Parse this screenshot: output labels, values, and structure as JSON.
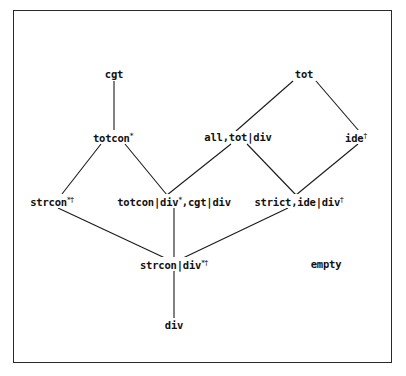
{
  "diagram": {
    "type": "lattice",
    "nodes": [
      {
        "id": "cgt",
        "label": "cgt",
        "sup": "",
        "x": 114,
        "y": 74
      },
      {
        "id": "tot",
        "label": "tot",
        "sup": "",
        "x": 304,
        "y": 74
      },
      {
        "id": "totcon",
        "label": "totcon",
        "sup": "*",
        "x": 113,
        "y": 137
      },
      {
        "id": "all_tot_div",
        "label": "all,tot|div",
        "sup": "",
        "x": 238,
        "y": 137
      },
      {
        "id": "ide",
        "label": "ide",
        "sup": "†",
        "x": 356,
        "y": 137
      },
      {
        "id": "strcon",
        "label": "strcon",
        "sup": "*†",
        "x": 52,
        "y": 201
      },
      {
        "id": "totcon_div_cgt_div",
        "label": "totcon|div",
        "sup": "*",
        "label2": ",cgt|div",
        "x": 174,
        "y": 201
      },
      {
        "id": "strict_ide_div",
        "label": "strict,ide|div",
        "sup": "†",
        "x": 299,
        "y": 201
      },
      {
        "id": "strcon_div",
        "label": "strcon|div",
        "sup": "*†",
        "x": 174,
        "y": 264
      },
      {
        "id": "empty",
        "label": "empty",
        "sup": "",
        "x": 326,
        "y": 264
      },
      {
        "id": "div",
        "label": "div",
        "sup": "",
        "x": 174,
        "y": 325
      }
    ],
    "edges": [
      {
        "from": "cgt",
        "to": "totcon",
        "x1": 114,
        "y1": 81,
        "x2": 114,
        "y2": 130
      },
      {
        "from": "tot",
        "to": "all_tot_div",
        "x1": 293,
        "y1": 81,
        "x2": 236,
        "y2": 131
      },
      {
        "from": "tot",
        "to": "ide",
        "x1": 316,
        "y1": 81,
        "x2": 359,
        "y2": 131
      },
      {
        "from": "totcon",
        "to": "strcon",
        "x1": 101,
        "y1": 144,
        "x2": 62,
        "y2": 194
      },
      {
        "from": "totcon",
        "to": "totcon_div_cgt_div",
        "x1": 125,
        "y1": 144,
        "x2": 167,
        "y2": 195
      },
      {
        "from": "all_tot_div",
        "to": "totcon_div_cgt_div",
        "x1": 231,
        "y1": 144,
        "x2": 167,
        "y2": 195
      },
      {
        "from": "all_tot_div",
        "to": "strict_ide_div",
        "x1": 247,
        "y1": 144,
        "x2": 296,
        "y2": 195
      },
      {
        "from": "ide",
        "to": "strict_ide_div",
        "x1": 358,
        "y1": 144,
        "x2": 296,
        "y2": 195
      },
      {
        "from": "strcon",
        "to": "strcon_div",
        "x1": 58,
        "y1": 208,
        "x2": 165,
        "y2": 258
      },
      {
        "from": "totcon_div_cgt_div",
        "to": "strcon_div",
        "x1": 174,
        "y1": 208,
        "x2": 174,
        "y2": 258
      },
      {
        "from": "strict_ide_div",
        "to": "strcon_div",
        "x1": 288,
        "y1": 208,
        "x2": 183,
        "y2": 258
      },
      {
        "from": "strcon_div",
        "to": "div",
        "x1": 174,
        "y1": 271,
        "x2": 174,
        "y2": 318
      }
    ]
  },
  "colors": {
    "background": "#ffffff",
    "ink": "#111111",
    "frame": "#2a2a2a"
  }
}
